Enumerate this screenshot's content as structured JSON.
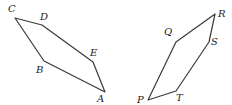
{
  "figures": [
    {
      "name": "pentagon-ABCDE",
      "vertices": [
        {
          "label": "C",
          "x": 15,
          "y": 18,
          "lx": 8,
          "ly": 4
        },
        {
          "label": "D",
          "x": 42,
          "y": 25,
          "lx": 40,
          "ly": 12
        },
        {
          "label": "E",
          "x": 93,
          "y": 62,
          "lx": 90,
          "ly": 48
        },
        {
          "label": "A",
          "x": 105,
          "y": 92,
          "lx": 97,
          "ly": 94
        },
        {
          "label": "B",
          "x": 44,
          "y": 61,
          "lx": 36,
          "ly": 65
        }
      ]
    },
    {
      "name": "pentagon-PQRST",
      "vertices": [
        {
          "label": "R",
          "x": 215,
          "y": 14,
          "lx": 218,
          "ly": 9
        },
        {
          "label": "S",
          "x": 209,
          "y": 42,
          "lx": 211,
          "ly": 37
        },
        {
          "label": "T",
          "x": 176,
          "y": 91,
          "lx": 176,
          "ly": 93
        },
        {
          "label": "P",
          "x": 148,
          "y": 100,
          "lx": 137,
          "ly": 95
        },
        {
          "label": "Q",
          "x": 176,
          "y": 42,
          "lx": 164,
          "ly": 27
        }
      ]
    }
  ],
  "labels": {
    "C": "C",
    "D": "D",
    "E": "E",
    "A": "A",
    "B": "B",
    "P": "P",
    "Q": "Q",
    "R": "R",
    "S": "S",
    "T": "T"
  }
}
